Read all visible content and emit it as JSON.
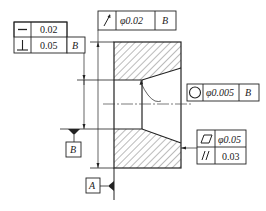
{
  "drawing": {
    "type": "GD&T section drawing of bored part",
    "colors": {
      "line": "#222222",
      "hatch": "#555555",
      "background": "#ffffff"
    }
  },
  "frames": {
    "form_frame": {
      "rows": [
        {
          "symbol": "straightness",
          "glyph": "—",
          "tolerance": "0.02",
          "datum": ""
        },
        {
          "symbol": "perpendicularity",
          "glyph": "⊥",
          "tolerance": "0.05",
          "datum": "B"
        }
      ]
    },
    "runout_frame": {
      "symbol": "circular-runout",
      "glyph": "↗",
      "tolerance": "φ0.02",
      "datum": "B"
    },
    "circularity_frame": {
      "symbol": "circularity",
      "glyph": "○",
      "tolerance": "φ0.005",
      "datum": "B"
    },
    "flat_parallel_frame": {
      "rows": [
        {
          "symbol": "flatness",
          "glyph": "▱",
          "tolerance": "φ0.05"
        },
        {
          "symbol": "parallelism",
          "glyph": "//",
          "tolerance": "0.03"
        }
      ]
    }
  },
  "datums": {
    "B": {
      "label": "B"
    },
    "A": {
      "label": "A"
    }
  }
}
